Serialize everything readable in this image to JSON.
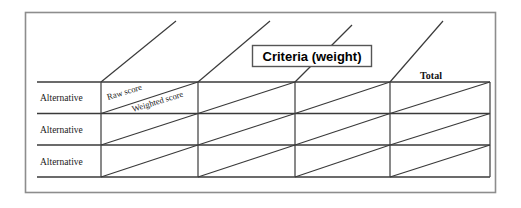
{
  "figure": {
    "type": "decision-matrix-diagram",
    "callout": {
      "label": "Criteria (weight)"
    },
    "total_column_header": "Total",
    "cell_split_labels": {
      "upper": "Raw score",
      "lower": "Weighted score"
    },
    "row_labels": [
      "Alternative",
      "Alternative",
      "Alternative"
    ],
    "columns": [
      {
        "name": "criterion-1",
        "header": ""
      },
      {
        "name": "criterion-2",
        "header": ""
      },
      {
        "name": "criterion-3",
        "header": ""
      },
      {
        "name": "total",
        "header": "Total"
      }
    ],
    "colors": {
      "background": "#ffffff",
      "frame": "#8d8d8d",
      "grid": "#3a3a3a",
      "text": "#111111"
    }
  }
}
